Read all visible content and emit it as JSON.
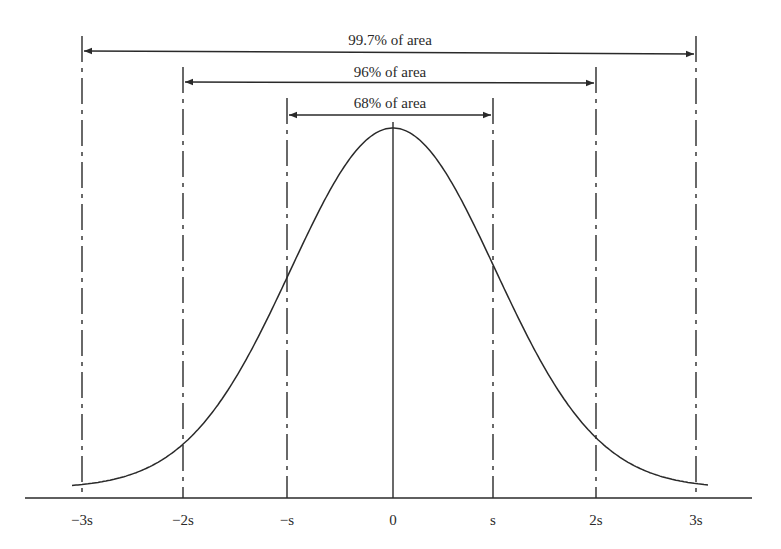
{
  "chart_data": {
    "type": "line",
    "title": "",
    "xlabel": "",
    "ylabel": "",
    "x_ticks": [
      "−3s",
      "−2s",
      "−s",
      "0",
      "s",
      "2s",
      "3s"
    ],
    "x_values": [
      -3,
      -2,
      -1,
      0,
      1,
      2,
      3
    ],
    "annotations": [
      {
        "label": "99.7% of area",
        "from": -3,
        "to": 3
      },
      {
        "label": "96% of area",
        "from": -2,
        "to": 2
      },
      {
        "label": "68% of area",
        "from": -1,
        "to": 1
      }
    ],
    "curve": "standard normal density",
    "grid": false,
    "legend": "none"
  },
  "ticks": {
    "m3": "−3s",
    "m2": "−2s",
    "m1": "−s",
    "z": "0",
    "p1": "s",
    "p2": "2s",
    "p3": "3s"
  },
  "spans": {
    "s3": "99.7% of area",
    "s2": "96% of area",
    "s1": "68% of area"
  },
  "colors": {
    "ink": "#2a2a2a",
    "background": "#ffffff"
  }
}
